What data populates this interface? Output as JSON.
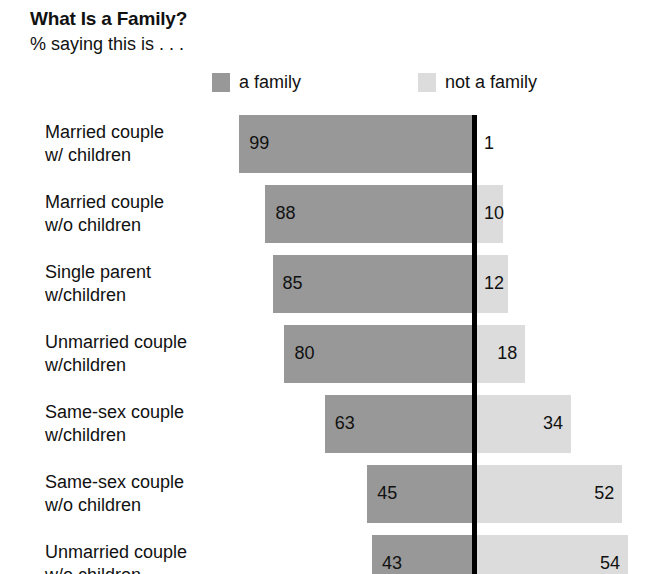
{
  "header": {
    "title": "What Is a Family?",
    "subtitle": "% saying this is . . ."
  },
  "legend": {
    "items": [
      {
        "label": "a family",
        "color": "#989898"
      },
      {
        "label": "not a family",
        "color": "#dcdcdc"
      }
    ]
  },
  "chart_data": {
    "type": "bar",
    "title": "What Is a Family?",
    "subtitle": "% saying this is . . .",
    "xlabel": "",
    "ylabel": "",
    "orientation": "horizontal",
    "stacked": "diverging",
    "grid": false,
    "legend_position": "top",
    "categories": [
      "Married couple\nw/ children",
      "Married couple\nw/o children",
      "Single parent\nw/children",
      "Unmarried couple\nw/children",
      "Same-sex couple\nw/children",
      "Same-sex couple\nw/o children",
      "Unmarried couple\nw/o children"
    ],
    "category_lines": [
      [
        "Married couple",
        "w/ children"
      ],
      [
        "Married couple",
        "w/o children"
      ],
      [
        "Single parent",
        "w/children"
      ],
      [
        "Unmarried couple",
        "w/children"
      ],
      [
        "Same-sex couple",
        "w/children"
      ],
      [
        "Same-sex couple",
        "w/o children"
      ],
      [
        "Unmarried couple",
        "w/o children"
      ]
    ],
    "series": [
      {
        "name": "a family",
        "color": "#989898",
        "values": [
          99,
          88,
          85,
          80,
          63,
          45,
          43
        ]
      },
      {
        "name": "not a family",
        "color": "#dcdcdc",
        "values": [
          1,
          10,
          12,
          18,
          34,
          52,
          54
        ]
      }
    ]
  },
  "rows": [
    {
      "line1": "Married couple",
      "line2": "w/ children",
      "a_family": 99,
      "not_a_family": 1,
      "a_family_label": "99",
      "not_a_family_label": "1"
    },
    {
      "line1": "Married couple",
      "line2": "w/o children",
      "a_family": 88,
      "not_a_family": 10,
      "a_family_label": "88",
      "not_a_family_label": "10"
    },
    {
      "line1": "Single parent",
      "line2": "w/children",
      "a_family": 85,
      "not_a_family": 12,
      "a_family_label": "85",
      "not_a_family_label": "12"
    },
    {
      "line1": "Unmarried couple",
      "line2": "w/children",
      "a_family": 80,
      "not_a_family": 18,
      "a_family_label": "80",
      "not_a_family_label": "18"
    },
    {
      "line1": "Same-sex couple",
      "line2": "w/children",
      "a_family": 63,
      "not_a_family": 34,
      "a_family_label": "63",
      "not_a_family_label": "34"
    },
    {
      "line1": "Same-sex couple",
      "line2": "w/o children",
      "a_family": 45,
      "not_a_family": 52,
      "a_family_label": "45",
      "not_a_family_label": "52"
    },
    {
      "line1": "Unmarried couple",
      "line2": "w/o children",
      "a_family": 43,
      "not_a_family": 54,
      "a_family_label": "43",
      "not_a_family_label": "54"
    }
  ],
  "layout": {
    "axis_x": 474,
    "row_top": 115,
    "row_pitch": 70,
    "bar_height": 58,
    "left_scale": 2.37,
    "right_scale": 2.85
  },
  "colors": {
    "a_family": "#989898",
    "not_a_family": "#dcdcdc",
    "axis": "#000000",
    "text": "#111111",
    "background": "#ffffff"
  }
}
